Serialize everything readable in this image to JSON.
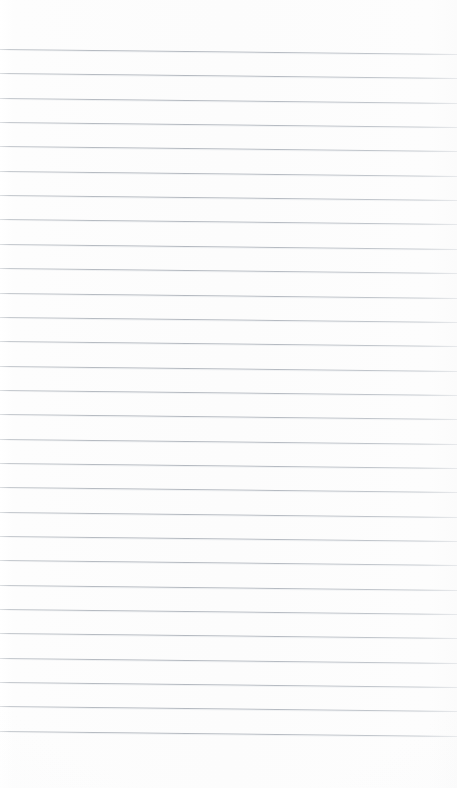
{
  "document": {
    "kind": "ruled-notebook-page",
    "title": "Blank lined page",
    "content_text": "",
    "page_width": 457,
    "page_height": 788,
    "is_blank": true
  },
  "paper": {
    "background_color": "#fdfdfd",
    "edge_color": "#ffffff",
    "vignette_color": "#f6f7f8"
  },
  "ruling": {
    "style": "wide-ruled horizontal lines",
    "line_color": "#b6bbc2",
    "line_color_light": "#c4c8cd",
    "ghost_color": "#e4e7ea",
    "line_count": 29,
    "line_thickness_px": 1,
    "first_line_y": 49,
    "line_spacing_px": 24.35,
    "skew_px_across_width": 5,
    "left_inset_px": 0,
    "right_inset_px": 0,
    "top_margin_px": 49,
    "bottom_margin_px": 55
  },
  "margins": {
    "top_label": "top margin",
    "bottom_label": "bottom margin"
  }
}
